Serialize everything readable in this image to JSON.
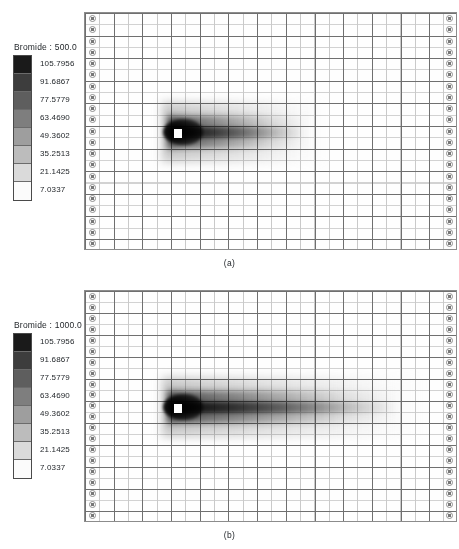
{
  "figure": {
    "background_color": "#ffffff",
    "panels": [
      {
        "id": "a",
        "label": "(a)",
        "legend": {
          "title": "Bromide : 500.0",
          "species": "Bromide",
          "time_value": "500.0",
          "labels": [
            "105.7956",
            "91.6867",
            "77.5779",
            "63.4690",
            "49.3602",
            "35.2513",
            "21.1425",
            "7.0337"
          ],
          "swatch_colors": [
            "#1a1a1a",
            "#3d3d3d",
            "#5e5e5e",
            "#7e7e7e",
            "#9e9e9e",
            "#bcbcbc",
            "#dadada",
            "#fbfbfb"
          ]
        }
      },
      {
        "id": "b",
        "label": "(b)",
        "legend": {
          "title": "Bromide : 1000.0",
          "species": "Bromide",
          "time_value": "1000.0",
          "labels": [
            "105.7956",
            "91.6867",
            "77.5779",
            "63.4690",
            "49.3602",
            "35.2513",
            "21.1425",
            "7.0337"
          ],
          "swatch_colors": [
            "#1a1a1a",
            "#3d3d3d",
            "#5e5e5e",
            "#7e7e7e",
            "#9e9e9e",
            "#bcbcbc",
            "#dadada",
            "#fbfbfb"
          ]
        }
      }
    ]
  },
  "chart_data": {
    "type": "heatmap",
    "xlabel": "",
    "ylabel": "",
    "grid": true,
    "legend_position": "left",
    "colorbar": {
      "orientation": "vertical",
      "n_bands": 8,
      "scale": "grayscale-dark-high",
      "tick_values": [
        105.7956,
        91.6867,
        77.5779,
        63.469,
        49.3602,
        35.2513,
        21.1425,
        7.0337
      ],
      "min": 7.0337,
      "max": 105.7956,
      "band_interval": 14.1089,
      "units": "mg/L"
    },
    "panels": [
      {
        "id": "a",
        "label": "(a)",
        "time": 500.0,
        "grid_columns": 26,
        "grid_rows": 21,
        "source_cell_x_fraction": 0.245,
        "source_cell_y_fraction": 0.5,
        "plume_extent_x_fraction": 0.62,
        "plume_peak_value": 105.7956,
        "boundary_markers_left": 21,
        "boundary_markers_right": 21
      },
      {
        "id": "b",
        "label": "(b)",
        "time": 1000.0,
        "grid_columns": 26,
        "grid_rows": 21,
        "source_cell_x_fraction": 0.245,
        "source_cell_y_fraction": 0.5,
        "plume_extent_x_fraction": 0.88,
        "plume_peak_value": 105.7956,
        "boundary_markers_left": 21,
        "boundary_markers_right": 21
      }
    ]
  }
}
